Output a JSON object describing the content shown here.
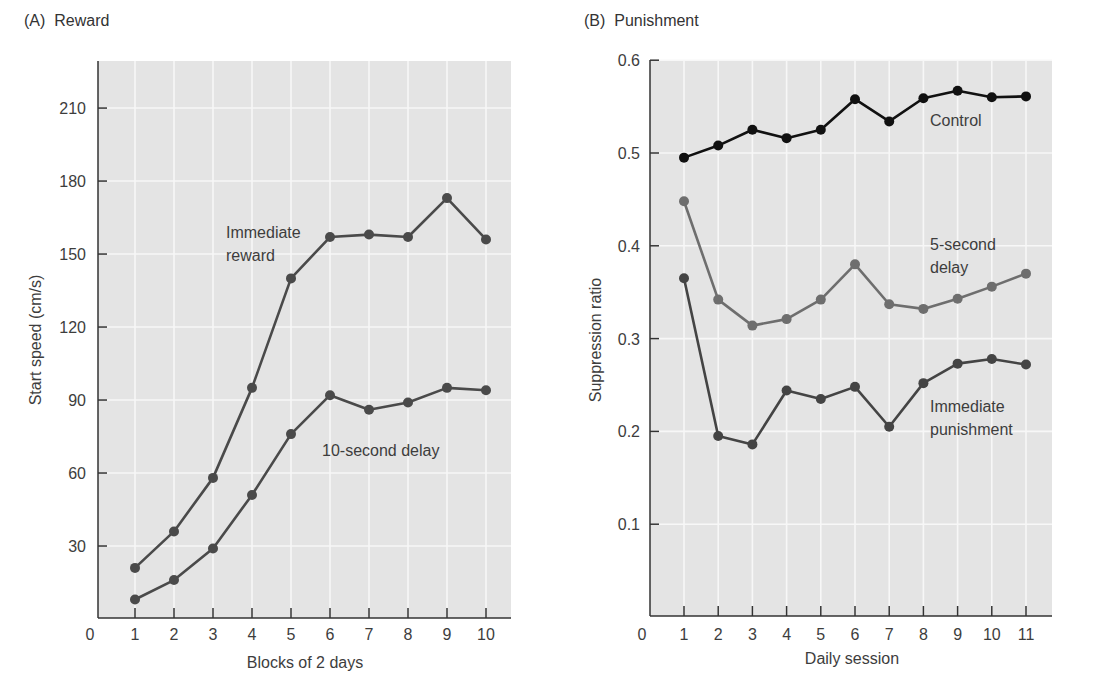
{
  "chart_data": [
    {
      "panel": "(A)",
      "title": "Reward",
      "type": "line",
      "xlabel": "Blocks of 2 days",
      "ylabel": "Start speed (cm/s)",
      "x": [
        1,
        2,
        3,
        4,
        5,
        6,
        7,
        8,
        9,
        10
      ],
      "x_ticks": [
        "0",
        "1",
        "2",
        "3",
        "4",
        "5",
        "6",
        "7",
        "8",
        "9",
        "10"
      ],
      "y_ticks": [
        "30",
        "60",
        "90",
        "120",
        "150",
        "180",
        "210"
      ],
      "ylim": [
        0,
        228
      ],
      "grid": true,
      "series": [
        {
          "name": "Immediate reward",
          "label_lines": [
            "Immediate",
            "reward"
          ],
          "color": "#4a4a4a",
          "values": [
            21,
            36,
            58,
            95,
            140,
            157,
            158,
            157,
            173,
            156
          ]
        },
        {
          "name": "10-second delay",
          "label_lines": [
            "10-second delay"
          ],
          "color": "#4a4a4a",
          "values": [
            8,
            16,
            29,
            51,
            76,
            92,
            86,
            89,
            95,
            94
          ]
        }
      ]
    },
    {
      "panel": "(B)",
      "title": "Punishment",
      "type": "line",
      "xlabel": "Daily session",
      "ylabel": "Suppression ratio",
      "x": [
        1,
        2,
        3,
        4,
        5,
        6,
        7,
        8,
        9,
        10,
        11
      ],
      "x_ticks": [
        "0",
        "1",
        "2",
        "3",
        "4",
        "5",
        "6",
        "7",
        "8",
        "9",
        "10",
        "11"
      ],
      "y_ticks": [
        "0.1",
        "0.2",
        "0.3",
        "0.4",
        "0.5",
        "0.6"
      ],
      "ylim": [
        0,
        0.6
      ],
      "grid": true,
      "series": [
        {
          "name": "Control",
          "label_lines": [
            "Control"
          ],
          "color": "#111111",
          "values": [
            0.495,
            0.508,
            0.525,
            0.516,
            0.525,
            0.558,
            0.534,
            0.559,
            0.567,
            0.56,
            0.561
          ]
        },
        {
          "name": "5-second delay",
          "label_lines": [
            "5-second",
            "delay"
          ],
          "color": "#6e6e6e",
          "values": [
            0.448,
            0.342,
            0.314,
            0.321,
            0.342,
            0.38,
            0.337,
            0.332,
            0.343,
            0.356,
            0.37
          ]
        },
        {
          "name": "Immediate punishment",
          "label_lines": [
            "Immediate",
            "punishment"
          ],
          "color": "#444444",
          "values": [
            0.365,
            0.195,
            0.186,
            0.244,
            0.235,
            0.248,
            0.205,
            0.252,
            0.273,
            0.278,
            0.272
          ]
        }
      ]
    }
  ],
  "panels": {
    "a": {
      "letter": "(A)",
      "title": "Reward"
    },
    "b": {
      "letter": "(B)",
      "title": "Punishment"
    }
  },
  "colors": {
    "plot_bg": "#e4e4e4",
    "grid": "#f7f7f7",
    "axis": "#333333"
  }
}
